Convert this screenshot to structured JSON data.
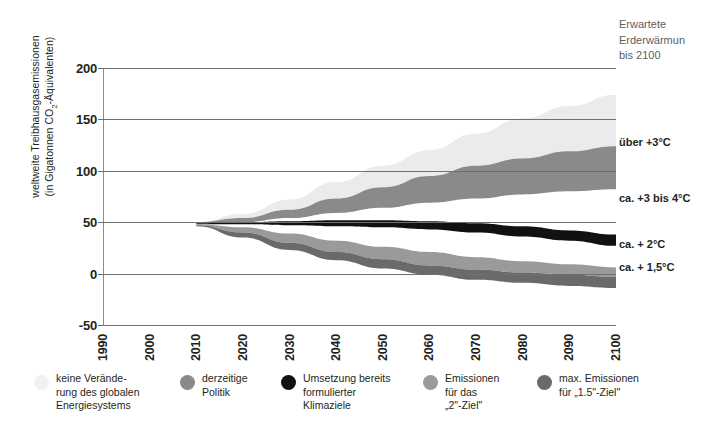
{
  "chart_data": {
    "type": "area",
    "title": "",
    "xlabel": "",
    "ylabel": "weltweite Treibhausgasemissionen (in Gigatonnen CO2-Äquivalenten)",
    "ylabel_line1": "weltweite Treibhausgasemissionen",
    "ylabel_line2_pre": "(in Gigatonnen CO",
    "ylabel_line2_sub": "2",
    "ylabel_line2_post": "-Äquivalenten)",
    "xlim": [
      1990,
      2100
    ],
    "ylim": [
      -50,
      200
    ],
    "yticks": [
      200,
      150,
      100,
      50,
      0,
      -50
    ],
    "xticks": [
      1990,
      2000,
      2010,
      2020,
      2030,
      2040,
      2050,
      2060,
      2070,
      2080,
      2090,
      2100
    ],
    "grid": true,
    "legend_position": "bottom",
    "x": [
      1990,
      2000,
      2010,
      2020,
      2030,
      2040,
      2050,
      2060,
      2070,
      2080,
      2090,
      2100
    ],
    "series": [
      {
        "name": "keine Veränderung des globalen Energiesystems",
        "color": "#ebebeb",
        "upper": [
          null,
          null,
          50,
          58,
          72,
          89,
          105,
          120,
          136,
          151,
          163,
          174
        ],
        "lower": [
          null,
          null,
          50,
          54,
          62,
          73,
          84,
          95,
          105,
          112,
          119,
          124
        ]
      },
      {
        "name": "derzeitige Politik",
        "color": "#8a8a8a",
        "upper": [
          null,
          null,
          50,
          54,
          62,
          73,
          84,
          95,
          105,
          112,
          119,
          124
        ],
        "lower": [
          null,
          null,
          49,
          50,
          54,
          59,
          64,
          69,
          73,
          77,
          80,
          82
        ]
      },
      {
        "name": "Umsetzung bereits formulierter Klimaziele",
        "color": "#111111",
        "upper": [
          null,
          null,
          49,
          50,
          51,
          52,
          52,
          51,
          49,
          46,
          42,
          38
        ],
        "lower": [
          null,
          null,
          48,
          48,
          47,
          46,
          45,
          43,
          40,
          36,
          32,
          27
        ]
      },
      {
        "name": "Emissionen für das „2\"-Ziel\"",
        "color": "#9a9a9a",
        "upper": [
          null,
          null,
          48,
          45,
          39,
          32,
          26,
          21,
          16,
          12,
          9,
          6
        ],
        "lower": [
          null,
          null,
          47,
          40,
          30,
          21,
          14,
          8,
          4,
          1,
          -1,
          -3
        ]
      },
      {
        "name": "max. Emissionen für „1.5\"-Ziel\"",
        "color": "#6a6a6a",
        "upper": [
          null,
          null,
          47,
          40,
          30,
          21,
          14,
          8,
          4,
          1,
          -1,
          -3
        ],
        "lower": [
          null,
          null,
          46,
          35,
          23,
          13,
          5,
          -1,
          -6,
          -9,
          -12,
          -14
        ]
      }
    ],
    "annotations": {
      "header": [
        "Erwartete",
        "Erderwärmun",
        "bis 2100"
      ],
      "items": [
        {
          "label": "über +3°C",
          "y_value": 127
        },
        {
          "label": "ca. +3 bis 4°C",
          "y_value": 73
        },
        {
          "label": "ca. + 2°C",
          "y_value": 28
        },
        {
          "label": "ca. + 1,5°C",
          "y_value": 5
        }
      ]
    },
    "legend": [
      {
        "label": "keine Verände-\nrung des globalen\nEnergiesystems",
        "color": "#f2f2f2",
        "x": 0,
        "text_w": 110
      },
      {
        "label": "derzeitige\nPolitik",
        "color": "#8a8a8a",
        "x": 146,
        "text_w": 80
      },
      {
        "label": "Umsetzung bereits\nformulierter\nKlimaziele",
        "color": "#111111",
        "x": 247,
        "text_w": 110
      },
      {
        "label": "Emissionen\nfür das\n„2\"-Ziel\"",
        "color": "#9a9a9a",
        "x": 389,
        "text_w": 95
      },
      {
        "label": "max. Emissionen\nfür „1.5\"-Ziel\"",
        "color": "#6a6a6a",
        "x": 503,
        "text_w": 120
      }
    ]
  }
}
